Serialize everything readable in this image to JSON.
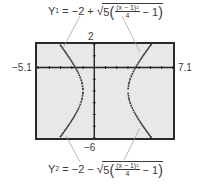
{
  "equations": {
    "y1": {
      "name": "Y",
      "sub": "1",
      "eq": "= −2 +",
      "coef": "5",
      "num": "(x − 1)²",
      "den": "4",
      "tail": "− 1"
    },
    "y2": {
      "name": "Y",
      "sub": "2",
      "eq": "= −2 −",
      "coef": "5",
      "num": "(x − 1)²",
      "den": "4",
      "tail": "− 1"
    }
  },
  "window": {
    "xmin": -5.1,
    "xmax": 7.1,
    "ymin": -6,
    "ymax": 2,
    "xmin_label": "−5.1",
    "xmax_label": "7.1",
    "ymin_label": "−6",
    "ymax_label": "2"
  },
  "colors": {
    "screen_bg": "#e8e8e8",
    "frame": "#2a2a2a",
    "curve": "#333333",
    "leader": "#9a9a9a",
    "axis": "#222222"
  },
  "chart_data": {
    "type": "line",
    "title": "",
    "xlabel": "",
    "ylabel": "",
    "xlim": [
      -5.1,
      7.1
    ],
    "ylim": [
      -6,
      2
    ],
    "series": [
      {
        "name": "Y1 = -2 + sqrt(5((x-1)^2/4 - 1))",
        "h": 1,
        "k": -2,
        "a2": 4,
        "b2": 5,
        "sign": 1
      },
      {
        "name": "Y2 = -2 - sqrt(5((x-1)^2/4 - 1))",
        "h": 1,
        "k": -2,
        "a2": 4,
        "b2": 5,
        "sign": -1
      }
    ],
    "vertices_x": [
      -1,
      3
    ],
    "grid": false
  }
}
